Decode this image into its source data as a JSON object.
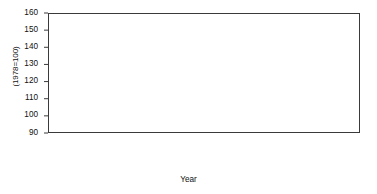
{
  "chart_data": {
    "type": "line",
    "title": "",
    "xlabel": "Year",
    "ylabel": "(1978=100)",
    "xlim": [
      66.5,
      88.5
    ],
    "ylim": [
      90,
      160
    ],
    "y_ticks": [
      90,
      100,
      110,
      120,
      130,
      140,
      150,
      160
    ],
    "x_ticks": [
      "67",
      "68",
      "69",
      "70",
      "71",
      "72",
      "73",
      "74",
      "75",
      "76",
      "77",
      "78",
      "79",
      "80",
      "81",
      "82",
      "83",
      "84",
      "85",
      "86",
      "87",
      "88"
    ],
    "grid": false,
    "legend": null,
    "line_color": "#1a1a1a",
    "categories": [
      1967,
      1968,
      1969,
      1970,
      1971,
      1972,
      1973,
      1974,
      1975,
      1976,
      1977,
      1978,
      1979,
      1980,
      1981,
      1982,
      1983,
      1984,
      1985,
      1986,
      1987,
      1988
    ],
    "values": [
      102.5,
      101.0,
      102.0,
      104.5,
      107.5,
      106.5,
      104.0,
      105.0,
      101.8,
      103.5,
      103.5,
      101.0,
      97.5,
      117.0,
      136.0,
      140.5,
      143.0,
      146.0,
      149.5,
      153.0,
      155.0,
      150.0
    ]
  },
  "axis": {
    "y_title": "(1978=100)",
    "x_title": "Year"
  }
}
